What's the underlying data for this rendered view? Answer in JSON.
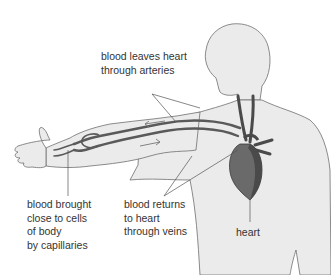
{
  "diagram": {
    "labels": {
      "arteries": "blood leaves heart\nthrough arteries",
      "capillaries": "blood brought\nclose to cells\nof body\nby capillaries",
      "veins": "blood returns\nto heart\nthrough veins",
      "heart": "heart"
    },
    "colors": {
      "body_fill": "#ebebeb",
      "body_outline": "#6e6e6e",
      "vessel": "#5a5a5a",
      "heart_fill": "#6a6a6a",
      "heart_dark": "#4a4a4a",
      "leader_line": "#555555",
      "text": "#333333"
    }
  }
}
